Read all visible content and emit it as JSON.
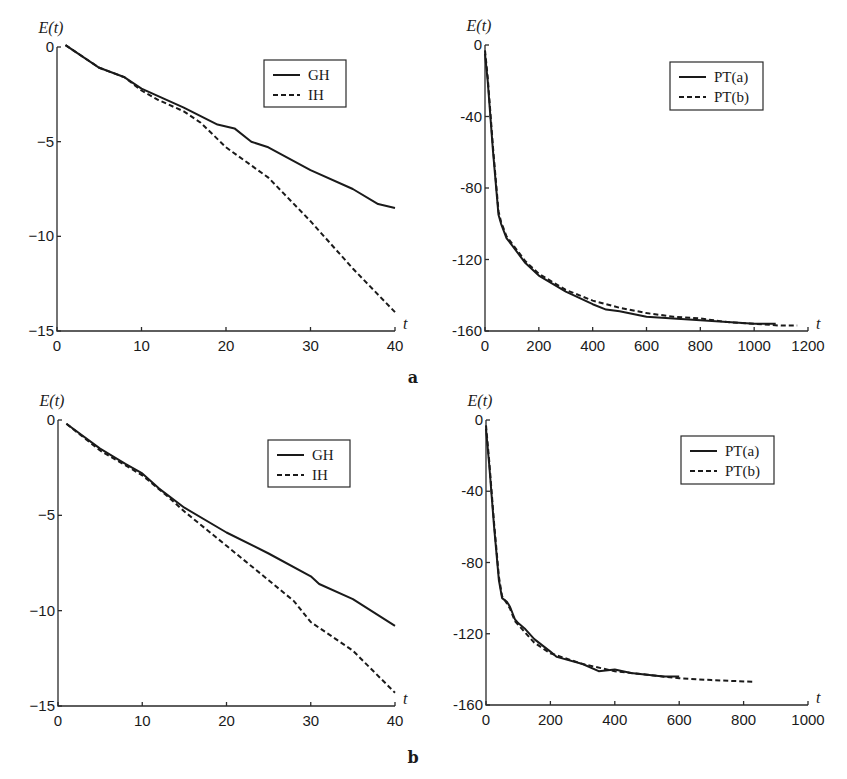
{
  "figure": {
    "panel_labels": [
      "a",
      "b"
    ]
  },
  "chart_data": [
    {
      "id": "a-left",
      "type": "line",
      "panel": "a",
      "title": "",
      "xlabel": "t",
      "ylabel": "E(t)",
      "xlim": [
        0,
        40
      ],
      "ylim": [
        -15,
        0
      ],
      "xticks": [
        0,
        10,
        20,
        30,
        40
      ],
      "yticks": [
        0,
        -5,
        -10,
        -15
      ],
      "xtick_labels": [
        "0",
        "10",
        "20",
        "30",
        "40"
      ],
      "ytick_labels": [
        "0",
        "−5",
        "−10",
        "−15"
      ],
      "grid": false,
      "legend_position": "upper right",
      "series": [
        {
          "name": "GH",
          "style": "solid",
          "x": [
            1,
            5,
            8,
            10,
            15,
            19,
            21,
            23,
            25,
            30,
            35,
            38,
            40
          ],
          "y": [
            0.1,
            -1.1,
            -1.6,
            -2.2,
            -3.2,
            -4.1,
            -4.3,
            -5.0,
            -5.3,
            -6.5,
            -7.5,
            -8.3,
            -8.5
          ]
        },
        {
          "name": "IH",
          "style": "dashed",
          "x": [
            1,
            5,
            8,
            10,
            12,
            15,
            17,
            20,
            25,
            30,
            35,
            40
          ],
          "y": [
            0.1,
            -1.1,
            -1.6,
            -2.3,
            -2.8,
            -3.4,
            -4.0,
            -5.3,
            -6.9,
            -9.2,
            -11.7,
            -14.0
          ]
        }
      ]
    },
    {
      "id": "a-right",
      "type": "line",
      "panel": "a",
      "title": "",
      "xlabel": "t",
      "ylabel": "E(t)",
      "xlim": [
        0,
        1200
      ],
      "ylim": [
        -160,
        0
      ],
      "xticks": [
        0,
        200,
        400,
        600,
        800,
        1000,
        1200
      ],
      "yticks": [
        0,
        -40,
        -80,
        -120,
        -160
      ],
      "xtick_labels": [
        "0",
        "200",
        "400",
        "600",
        "800",
        "1000",
        "1200"
      ],
      "ytick_labels": [
        "0",
        "-40",
        "-80",
        "-120",
        "-160"
      ],
      "grid": false,
      "legend_position": "upper right",
      "series": [
        {
          "name": "PT(a)",
          "style": "solid",
          "x": [
            0,
            10,
            30,
            50,
            60,
            80,
            100,
            150,
            200,
            300,
            400,
            450,
            500,
            600,
            700,
            800,
            900,
            1000,
            1080
          ],
          "y": [
            -5,
            -20,
            -60,
            -95,
            -100,
            -108,
            -112,
            -122,
            -129,
            -138,
            -145,
            -148,
            -149,
            -152,
            -153,
            -154,
            -155,
            -156,
            -156
          ]
        },
        {
          "name": "PT(b)",
          "style": "dashed",
          "x": [
            0,
            10,
            30,
            50,
            60,
            80,
            100,
            150,
            200,
            300,
            400,
            500,
            600,
            700,
            800,
            900,
            1000,
            1100,
            1160
          ],
          "y": [
            -3,
            -18,
            -58,
            -93,
            -99,
            -107,
            -111,
            -121,
            -128,
            -137,
            -143,
            -147,
            -150,
            -152,
            -153,
            -155,
            -156,
            -157,
            -157
          ]
        }
      ]
    },
    {
      "id": "b-left",
      "type": "line",
      "panel": "b",
      "title": "",
      "xlabel": "t",
      "ylabel": "E(t)",
      "xlim": [
        0,
        40
      ],
      "ylim": [
        -15,
        0
      ],
      "xticks": [
        0,
        10,
        20,
        30,
        40
      ],
      "yticks": [
        0,
        -5,
        -10,
        -15
      ],
      "xtick_labels": [
        "0",
        "10",
        "20",
        "30",
        "40"
      ],
      "ytick_labels": [
        "0",
        "−5",
        "−10",
        "−15"
      ],
      "grid": false,
      "legend_position": "upper right",
      "series": [
        {
          "name": "GH",
          "style": "solid",
          "x": [
            1,
            5,
            8,
            10,
            12,
            15,
            20,
            25,
            30,
            31,
            35,
            40
          ],
          "y": [
            -0.2,
            -1.5,
            -2.3,
            -2.8,
            -3.6,
            -4.6,
            -5.9,
            -7.0,
            -8.2,
            -8.6,
            -9.4,
            -10.8
          ]
        },
        {
          "name": "IH",
          "style": "dashed",
          "x": [
            1,
            5,
            10,
            13,
            15,
            20,
            25,
            28,
            30,
            35,
            40
          ],
          "y": [
            -0.2,
            -1.6,
            -2.9,
            -4.0,
            -4.8,
            -6.6,
            -8.4,
            -9.5,
            -10.6,
            -12.1,
            -14.3
          ]
        }
      ]
    },
    {
      "id": "b-right",
      "type": "line",
      "panel": "b",
      "title": "",
      "xlabel": "t",
      "ylabel": "E(t)",
      "xlim": [
        0,
        1000
      ],
      "ylim": [
        -160,
        0
      ],
      "xticks": [
        0,
        200,
        400,
        600,
        800,
        1000
      ],
      "yticks": [
        0,
        -40,
        -80,
        -120,
        -160
      ],
      "xtick_labels": [
        "0",
        "200",
        "400",
        "600",
        "800",
        "1000"
      ],
      "ytick_labels": [
        "0",
        "-40",
        "-80",
        "-120",
        "-160"
      ],
      "grid": false,
      "legend_position": "upper right",
      "series": [
        {
          "name": "PT(a)",
          "style": "solid",
          "x": [
            0,
            10,
            25,
            40,
            50,
            65,
            75,
            90,
            100,
            120,
            150,
            200,
            220,
            300,
            350,
            400,
            450,
            500,
            550,
            600
          ],
          "y": [
            -5,
            -25,
            -60,
            -90,
            -100,
            -102,
            -105,
            -112,
            -114,
            -117,
            -123,
            -130,
            -133,
            -137,
            -141,
            -140,
            -142,
            -143,
            -144,
            -144
          ]
        },
        {
          "name": "PT(b)",
          "style": "dashed",
          "x": [
            0,
            10,
            25,
            40,
            50,
            65,
            75,
            90,
            100,
            120,
            150,
            200,
            300,
            400,
            500,
            600,
            700,
            830
          ],
          "y": [
            -3,
            -23,
            -58,
            -88,
            -99,
            -103,
            -106,
            -113,
            -115,
            -119,
            -125,
            -131,
            -137,
            -141,
            -143,
            -145,
            -146,
            -147
          ]
        }
      ]
    }
  ]
}
